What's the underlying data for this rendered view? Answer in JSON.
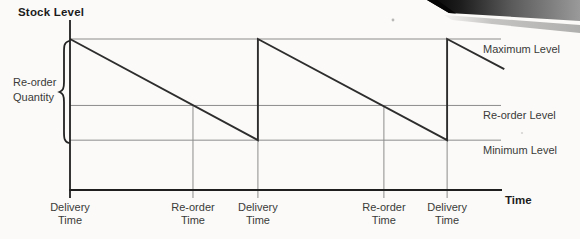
{
  "colors": {
    "background": "#fbfaf8",
    "axis_line": "#1f1f1f",
    "series_line": "#2d2d2d",
    "grid_line": "#8c8c8c",
    "label_text": "#3a3a3a",
    "title_text": "#1c1c1c"
  },
  "labels": {
    "title": "Stock Level",
    "time_axis": "Time",
    "reorder_quantity_line1": "Re-order",
    "reorder_quantity_line2": "Quantity"
  },
  "chart_data": {
    "type": "line",
    "title": "Stock Level",
    "xlabel": "Time",
    "ylabel": "Stock Level",
    "x_range": [
      0,
      10.6
    ],
    "y_range": [
      0,
      115
    ],
    "grid": "reference-lines-only",
    "axis_numeric_ticks": false,
    "series": [
      {
        "name": "stock-level-sawtooth",
        "points": [
          [
            0,
            100
          ],
          [
            4.37,
            33
          ],
          [
            4.37,
            100
          ],
          [
            8.77,
            33
          ],
          [
            8.77,
            100
          ],
          [
            10.1,
            80
          ]
        ]
      }
    ],
    "reference_levels": [
      {
        "name": "maximum",
        "label": "Maximum Level",
        "value": 100
      },
      {
        "name": "reorder",
        "label": "Re-order Level",
        "value": 56
      },
      {
        "name": "minimum",
        "label": "Minimum Level",
        "value": 33
      }
    ],
    "x_events": [
      {
        "t": 0,
        "type": "delivery",
        "label": "Delivery Time"
      },
      {
        "t": 2.86,
        "type": "reorder",
        "label": "Re-order Time"
      },
      {
        "t": 4.37,
        "type": "delivery",
        "label": "Delivery Time"
      },
      {
        "t": 7.3,
        "type": "reorder",
        "label": "Re-order Time"
      },
      {
        "t": 8.77,
        "type": "delivery",
        "label": "Delivery Time"
      }
    ],
    "annotations": [
      {
        "name": "reorder-quantity",
        "label": "Re-order Quantity",
        "spans": "maximum-level-to-minimum-level"
      }
    ]
  }
}
